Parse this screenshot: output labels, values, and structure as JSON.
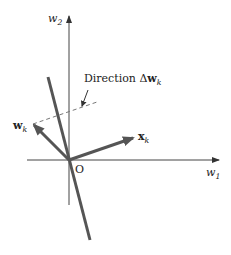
{
  "diagram": {
    "axes": {
      "vertical_label": "w",
      "vertical_sub": "2",
      "horizontal_label": "w",
      "horizontal_sub": "1",
      "origin_label": "O"
    },
    "vectors": [
      {
        "name": "w",
        "sub": "k",
        "style": "bold"
      },
      {
        "name": "x",
        "sub": "k",
        "style": "bold"
      }
    ],
    "annotation": {
      "prefix": "Direction Δ",
      "vec": "w",
      "sub": "k"
    },
    "colors": {
      "axis": "#444444",
      "vector": "#555555",
      "line": "#555555",
      "dashed": "#777777"
    }
  }
}
